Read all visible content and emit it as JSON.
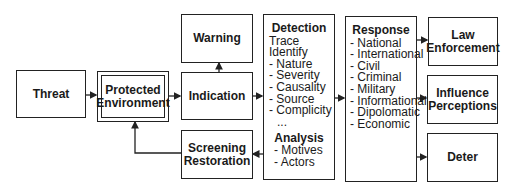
{
  "diagram": {
    "nodes": {
      "threat": "Threat",
      "protected_env": [
        "Protected",
        "Environment"
      ],
      "warning": "Warning",
      "indication": "Indication",
      "screening": [
        "Screening",
        "Restoration"
      ],
      "detection": {
        "title": "Detection",
        "items": [
          "Trace",
          "Identify",
          "- Nature",
          "- Severity",
          "- Causality",
          "- Source",
          "- Complicity",
          "  ..."
        ],
        "analysis_title": "Analysis",
        "analysis_items": [
          "- Motives",
          "- Actors"
        ]
      },
      "response": {
        "title": "Response",
        "items": [
          "- National",
          "- International",
          "- Civil",
          "- Criminal",
          "- Military",
          "- Informational",
          "- Dipolomatic",
          "- Economic"
        ]
      },
      "law": [
        "Law",
        "Enforcement"
      ],
      "influence": [
        "Influence",
        "Perceptions"
      ],
      "deter": "Deter"
    },
    "edges": [
      [
        "Threat",
        "Protected Environment"
      ],
      [
        "Protected Environment",
        "Indication"
      ],
      [
        "Indication",
        "Warning"
      ],
      [
        "Indication",
        "Detection"
      ],
      [
        "Detection",
        "Screening Restoration"
      ],
      [
        "Screening Restoration",
        "Protected Environment"
      ],
      [
        "Detection",
        "Response"
      ],
      [
        "Response",
        "Law Enforcement"
      ],
      [
        "Response",
        "Influence Perceptions"
      ],
      [
        "Response",
        "Deter"
      ]
    ]
  }
}
